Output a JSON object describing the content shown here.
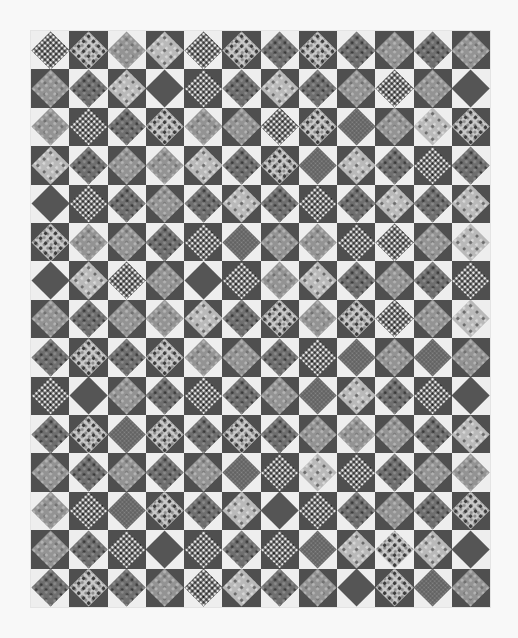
{
  "image": {
    "subject": "Grayscale photograph of a square-in-a-square patchwork quilt",
    "grid": {
      "columns": 12,
      "rows": 15
    },
    "colors": {
      "background": "#f8f8f8",
      "light_corner": "#eeeeee",
      "dark_corner": "#4f4f4f",
      "solid_diamond": "#555555"
    },
    "pattern_legend": {
      "S": "solid dark",
      "D": "dark mottled print",
      "F": "dark fine-dot print",
      "M": "medium gray print",
      "L": "light floral print",
      "B": "dark busy print with white spots",
      "W": "light print with dark spots"
    },
    "corner_rule": "checkerboard: block (row 0, col 0) has light corners, alternating",
    "rows": [
      [
        "B",
        "W",
        "M",
        "L",
        "B",
        "W",
        "D",
        "W",
        "D",
        "M",
        "D",
        "M"
      ],
      [
        "M",
        "D",
        "L",
        "S",
        "B",
        "D",
        "L",
        "D",
        "M",
        "B",
        "M",
        "S"
      ],
      [
        "M",
        "B",
        "D",
        "W",
        "M",
        "M",
        "B",
        "W",
        "F",
        "M",
        "L",
        "W"
      ],
      [
        "L",
        "D",
        "M",
        "M",
        "L",
        "D",
        "W",
        "F",
        "L",
        "D",
        "B",
        "D"
      ],
      [
        "S",
        "B",
        "D",
        "M",
        "D",
        "L",
        "D",
        "B",
        "D",
        "L",
        "D",
        "L"
      ],
      [
        "W",
        "M",
        "M",
        "D",
        "B",
        "F",
        "M",
        "M",
        "B",
        "B",
        "M",
        "L"
      ],
      [
        "S",
        "L",
        "B",
        "M",
        "S",
        "B",
        "M",
        "L",
        "D",
        "M",
        "D",
        "B"
      ],
      [
        "M",
        "D",
        "M",
        "M",
        "L",
        "D",
        "W",
        "M",
        "W",
        "B",
        "M",
        "L"
      ],
      [
        "D",
        "W",
        "D",
        "W",
        "M",
        "M",
        "D",
        "B",
        "F",
        "M",
        "F",
        "M"
      ],
      [
        "B",
        "S",
        "M",
        "D",
        "B",
        "D",
        "M",
        "F",
        "L",
        "D",
        "B",
        "S"
      ],
      [
        "D",
        "W",
        "F",
        "W",
        "D",
        "W",
        "D",
        "M",
        "M",
        "M",
        "D",
        "L"
      ],
      [
        "M",
        "D",
        "M",
        "D",
        "M",
        "F",
        "B",
        "L",
        "B",
        "D",
        "M",
        "M"
      ],
      [
        "M",
        "B",
        "F",
        "W",
        "D",
        "L",
        "S",
        "B",
        "D",
        "M",
        "D",
        "W"
      ],
      [
        "M",
        "D",
        "B",
        "S",
        "B",
        "D",
        "B",
        "F",
        "L",
        "W",
        "L",
        "S"
      ],
      [
        "D",
        "W",
        "D",
        "M",
        "B",
        "L",
        "D",
        "M",
        "S",
        "W",
        "F",
        "M"
      ]
    ]
  }
}
